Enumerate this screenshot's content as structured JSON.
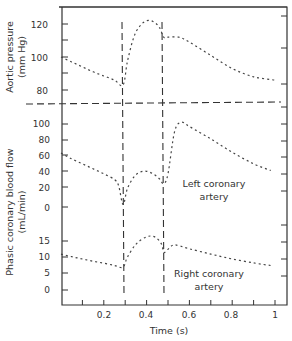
{
  "chart_data": {
    "type": "line",
    "title": "",
    "xlabel": "Time (s)",
    "xlim": [
      0,
      1.05
    ],
    "x_ticks": [
      0.2,
      0.4,
      0.6,
      0.8,
      1
    ],
    "x_tick_labels": [
      "0.2",
      "0.4",
      "0.6",
      "0.8",
      "1"
    ],
    "x_minor_ticks": [
      0.1,
      0.2,
      0.3,
      0.4,
      0.5,
      0.6,
      0.7,
      0.8,
      0.9,
      1.0
    ],
    "grid": false,
    "legend": null,
    "vertical_markers": [
      {
        "x": 0.29,
        "style": "dashed",
        "label": ""
      },
      {
        "x": 0.48,
        "style": "dashed",
        "label": ""
      }
    ],
    "panels": [
      {
        "name": "aortic-pressure",
        "ylabel": "Aortic pressure\n(mm Hg)",
        "ylabel_lines": [
          "Aortic pressure",
          "(mm Hg)"
        ],
        "y_ticks": [
          80,
          100,
          120
        ],
        "y_tick_labels": [
          "80",
          "100",
          "120"
        ],
        "ylim": [
          75,
          125
        ],
        "series": [
          {
            "name": "Aortic pressure",
            "style": "dotted",
            "x": [
              0.0,
              0.05,
              0.1,
              0.15,
              0.2,
              0.25,
              0.29,
              0.31,
              0.34,
              0.37,
              0.4,
              0.43,
              0.46,
              0.48,
              0.5,
              0.55,
              0.6,
              0.7,
              0.8,
              0.9,
              1.0
            ],
            "y": [
              100,
              97,
              94,
              91,
              88.5,
              86,
              83,
              97,
              112,
              119,
              122,
              121.5,
              118,
              112,
              112,
              112,
              109,
              101,
              93,
              88,
              86
            ]
          }
        ]
      },
      {
        "name": "left-coronary",
        "ylabel": "",
        "y_ticks": [
          0,
          20,
          40,
          60,
          80,
          100
        ],
        "y_tick_labels": [
          "0",
          "20",
          "40",
          "60",
          "80",
          "100"
        ],
        "ylim": [
          -10,
          110
        ],
        "annotation": "Left coronary artery",
        "annotation_lines": [
          "Left coronary",
          "artery"
        ],
        "series": [
          {
            "name": "Left coronary artery",
            "style": "dotted",
            "x": [
              0.0,
              0.05,
              0.1,
              0.15,
              0.2,
              0.25,
              0.27,
              0.29,
              0.31,
              0.34,
              0.37,
              0.4,
              0.43,
              0.46,
              0.48,
              0.5,
              0.53,
              0.56,
              0.6,
              0.7,
              0.8,
              0.9,
              0.98
            ],
            "y": [
              65,
              58,
              52,
              46,
              40,
              33,
              25,
              3,
              22,
              36,
              42,
              43,
              40,
              34,
              28,
              40,
              90,
              102,
              97,
              82,
              66,
              52,
              44
            ]
          }
        ]
      },
      {
        "name": "right-coronary",
        "ylabel": "",
        "y_ticks": [
          0,
          5,
          10,
          15
        ],
        "y_tick_labels": [
          "0",
          "5",
          "10",
          "15"
        ],
        "ylim": [
          -2,
          20
        ],
        "annotation": "Right coronary artery",
        "annotation_lines": [
          "Right coronary",
          "artery"
        ],
        "series": [
          {
            "name": "Right coronary artery",
            "style": "dotted",
            "x": [
              0.0,
              0.05,
              0.1,
              0.15,
              0.2,
              0.25,
              0.29,
              0.31,
              0.35,
              0.4,
              0.44,
              0.47,
              0.48,
              0.5,
              0.53,
              0.6,
              0.7,
              0.8,
              0.9,
              0.98
            ],
            "y": [
              11,
              10.2,
              9.5,
              8.8,
              8.2,
              7.5,
              7,
              10,
              14,
              16.3,
              16.2,
              14,
              11.5,
              12.5,
              13.8,
              12.6,
              11,
              9.5,
              8.3,
              7.5
            ]
          }
        ]
      }
    ],
    "shared_ylabel": "Phasic coronary blood flow\n(mL/min)",
    "shared_ylabel_lines": [
      "Phasic coronary blood flow",
      "(mL/min)"
    ]
  },
  "labels": {
    "xlabel": "Time (s)",
    "aortic_ylabel_1": "Aortic pressure",
    "aortic_ylabel_2": "(mm Hg)",
    "flow_ylabel_1": "Phasic coronary blood flow",
    "flow_ylabel_2": "(mL/min)",
    "left_annot_1": "Left coronary",
    "left_annot_2": "artery",
    "right_annot_1": "Right coronary",
    "right_annot_2": "artery",
    "x_ticks": [
      "0.2",
      "0.4",
      "0.6",
      "0.8",
      "1"
    ],
    "aortic_ticks": [
      "120",
      "100",
      "80"
    ],
    "left_ticks": [
      "100",
      "80",
      "60",
      "40",
      "20",
      "0"
    ],
    "right_ticks": [
      "15",
      "10",
      "5",
      "0"
    ]
  }
}
